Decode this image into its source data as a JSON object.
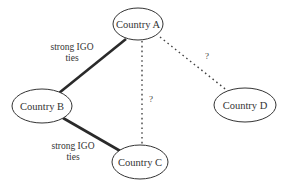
{
  "diagram": {
    "nodes": [
      {
        "id": "A",
        "label": "Country A",
        "cx": 138,
        "cy": 24,
        "rx": 25,
        "ry": 16
      },
      {
        "id": "B",
        "label": "Country B",
        "cx": 42,
        "cy": 106,
        "rx": 30,
        "ry": 17
      },
      {
        "id": "C",
        "label": "Country C",
        "cx": 140,
        "cy": 162,
        "rx": 28,
        "ry": 17
      },
      {
        "id": "D",
        "label": "Country D",
        "cx": 245,
        "cy": 105,
        "rx": 31,
        "ry": 17
      }
    ],
    "edges": [
      {
        "id": "A-B",
        "from": "A",
        "to": "B",
        "style": "solid",
        "x1": 126,
        "y1": 39,
        "x2": 59,
        "y2": 93,
        "label_lines": [
          "strong IGO",
          "ties"
        ],
        "label_x": 72,
        "label_y1": 47,
        "label_y2": 58
      },
      {
        "id": "B-C",
        "from": "B",
        "to": "C",
        "style": "solid",
        "x1": 63,
        "y1": 118,
        "x2": 122,
        "y2": 152,
        "label_lines": [
          "strong IGO",
          "ties"
        ],
        "label_x": 73,
        "label_y1": 146,
        "label_y2": 157
      },
      {
        "id": "A-C",
        "from": "A",
        "to": "C",
        "style": "dotted",
        "x1": 142,
        "y1": 41,
        "x2": 142,
        "y2": 146,
        "label": "?",
        "label_x": 151,
        "label_y": 99
      },
      {
        "id": "A-D",
        "from": "A",
        "to": "D",
        "style": "dotted",
        "x1": 160,
        "y1": 37,
        "x2": 229,
        "y2": 92,
        "label": "?",
        "label_x": 207,
        "label_y": 56
      }
    ]
  },
  "labels": {
    "node_a": "Country A",
    "node_b": "Country B",
    "node_c": "Country C",
    "node_d": "Country D",
    "edge_ab_line1": "strong IGO",
    "edge_ab_line2": "ties",
    "edge_bc_line1": "strong IGO",
    "edge_bc_line2": "ties",
    "edge_ac_q": "?",
    "edge_ad_q": "?"
  },
  "colors": {
    "background": "#ffffff",
    "stroke": "#333333",
    "text": "#333333"
  }
}
